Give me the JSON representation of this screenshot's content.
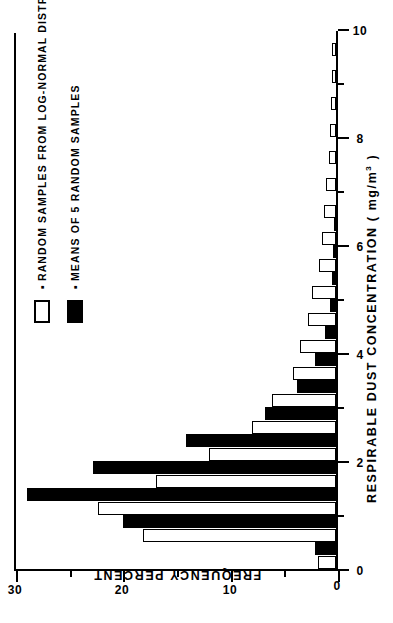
{
  "chart_data": {
    "type": "bar",
    "title": "",
    "subtitle": "",
    "xlabel": "RESPIRABLE  DUST  CONCENTRATION   ( mg/m",
    "xlabel_sup": "3",
    "xlabel_tail": " )",
    "ylabel": "FREQUENCY  PERCENT",
    "xlim": [
      0,
      10
    ],
    "ylim": [
      0,
      30
    ],
    "xticks": [
      0,
      2,
      4,
      6,
      8,
      10
    ],
    "xticks_labels": [
      "0",
      "2",
      "4",
      "6",
      "8",
      "10"
    ],
    "xminor": [
      1,
      3,
      5,
      7,
      9
    ],
    "yticks": [
      0,
      10,
      20,
      30
    ],
    "yticks_labels": [
      "0",
      "10",
      "20",
      "30"
    ],
    "yminor": [
      5,
      15,
      25
    ],
    "grid": false,
    "orientation": "figure printed rotated 90 degrees counter-clockwise",
    "legend_position": "upper right",
    "bin_width": 0.25,
    "series": [
      {
        "name": "RANDOM  SAMPLES  FROM  LOG-NORMAL  DISTRIBUTION",
        "swatch": "open",
        "color": "#ffffff",
        "edge_color": "#000000",
        "x": [
          0.125,
          0.375,
          0.625,
          0.875,
          1.125,
          1.375,
          1.625,
          1.875,
          2.125,
          2.375,
          2.625,
          2.875,
          3.125,
          3.375,
          3.625,
          3.875,
          4.125,
          4.375,
          4.625,
          4.875,
          5.125,
          5.375,
          5.625,
          5.875,
          6.125,
          6.375,
          6.625,
          6.875,
          7.125,
          7.375,
          7.625,
          7.875,
          8.125,
          8.375,
          8.625,
          8.875,
          9.125,
          9.375,
          9.625,
          9.875
        ],
        "values": [
          1.7,
          0,
          18.0,
          0,
          22.2,
          0,
          16.8,
          0,
          11.8,
          0,
          7.8,
          0,
          6.0,
          0,
          4.0,
          0,
          3.4,
          0,
          2.6,
          0,
          2.2,
          0,
          1.6,
          0,
          1.3,
          0,
          1.1,
          0,
          0.9,
          0,
          0.7,
          0,
          0.6,
          0,
          0.5,
          0,
          0.4,
          0,
          0.4,
          0
        ]
      },
      {
        "name": "MEANS  OF  5  RANDOM  SAMPLES",
        "swatch": "solid",
        "color": "#000000",
        "edge_color": "#000000",
        "x": [
          0.125,
          0.375,
          0.625,
          0.875,
          1.125,
          1.375,
          1.625,
          1.875,
          2.125,
          2.375,
          2.625,
          2.875,
          3.125,
          3.375,
          3.625,
          3.875,
          4.125,
          4.375,
          4.625,
          4.875,
          5.125,
          5.375,
          5.625,
          5.875,
          6.125,
          6.375
        ],
        "values": [
          0,
          2.0,
          0,
          19.8,
          0,
          28.8,
          0,
          22.6,
          0,
          14.0,
          0,
          6.6,
          0,
          3.6,
          0,
          2.0,
          0,
          1.0,
          0,
          0.6,
          0,
          0.4,
          0,
          0.3,
          0,
          0.2
        ]
      }
    ]
  },
  "legend": {
    "bullet": "▪",
    "entries": [
      {
        "label": "RANDOM  SAMPLES  FROM  LOG-NORMAL  DISTRIBUTION",
        "swatch": "open"
      },
      {
        "label": "MEANS  OF  5  RANDOM  SAMPLES",
        "swatch": "solid"
      }
    ]
  }
}
